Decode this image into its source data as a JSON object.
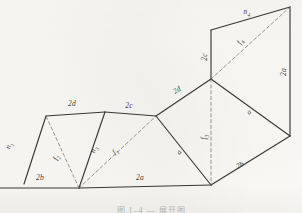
{
  "figure": {
    "background_color": "#fbfaf7",
    "stroke_color": "#2b2a28",
    "dash_color": "#6f6c67",
    "caption": "图 1–4  —  展开图",
    "solid_edges": [
      {
        "name": "edge-2d-upper-left",
        "x1": 24,
        "y1": 184,
        "x2": 46,
        "y2": 116
      },
      {
        "name": "edge-top-left-2d",
        "x1": 46,
        "y1": 116,
        "x2": 105,
        "y2": 112
      },
      {
        "name": "edge-top-2c",
        "x1": 105,
        "y1": 112,
        "x2": 156,
        "y2": 116
      },
      {
        "name": "edge-2d-diagonal-up",
        "x1": 156,
        "y1": 116,
        "x2": 211,
        "y2": 79
      },
      {
        "name": "edge-2c-vertical",
        "x1": 211,
        "y1": 79,
        "x2": 211,
        "y2": 30
      },
      {
        "name": "edge-n4-top",
        "x1": 211,
        "y1": 30,
        "x2": 290,
        "y2": 7
      },
      {
        "name": "edge-2a-right",
        "x1": 290,
        "y1": 7,
        "x2": 290,
        "y2": 136
      },
      {
        "name": "edge-right-lower",
        "x1": 290,
        "y1": 136,
        "x2": 211,
        "y2": 185
      },
      {
        "name": "edge-bottom-2a",
        "x1": 211,
        "y1": 185,
        "x2": 79,
        "y2": 188
      },
      {
        "name": "edge-bottom-2b",
        "x1": 79,
        "y1": 188,
        "x2": 0,
        "y2": 188
      },
      {
        "name": "edge-n3-interior",
        "x1": 79,
        "y1": 188,
        "x2": 105,
        "y2": 112
      },
      {
        "name": "edge-a-interior-left",
        "x1": 211,
        "y1": 185,
        "x2": 156,
        "y2": 116
      },
      {
        "name": "edge-a-interior-right",
        "x1": 211,
        "y1": 79,
        "x2": 290,
        "y2": 136
      }
    ],
    "dashed_edges": [
      {
        "name": "fold-f2",
        "x1": 79,
        "y1": 188,
        "x2": 46,
        "y2": 116
      },
      {
        "name": "fold-f1",
        "x1": 79,
        "y1": 188,
        "x2": 156,
        "y2": 116
      },
      {
        "name": "fold-f3-vertical",
        "x1": 211,
        "y1": 79,
        "x2": 211,
        "y2": 185
      },
      {
        "name": "fold-f4",
        "x1": 211,
        "y1": 79,
        "x2": 290,
        "y2": 7
      }
    ],
    "labels": [
      {
        "name": "label-n1",
        "text": "n",
        "sub": "1",
        "x": 10,
        "y": 146,
        "rot": -70
      },
      {
        "name": "label-2d",
        "text": "2d",
        "sub": "",
        "x": 72,
        "y": 104,
        "rot": 0
      },
      {
        "name": "label-2c",
        "text": "2c",
        "sub": "",
        "x": 129,
        "y": 106,
        "rot": 0
      },
      {
        "name": "label-2b",
        "text": "2b",
        "sub": "",
        "x": 40,
        "y": 178,
        "rot": 0
      },
      {
        "name": "label-2a",
        "text": "2a",
        "sub": "",
        "x": 140,
        "y": 178,
        "rot": 0
      },
      {
        "name": "label-f2",
        "text": "f",
        "sub": "2",
        "x": 57,
        "y": 158,
        "rot": -66
      },
      {
        "name": "label-n3",
        "text": "n",
        "sub": "3",
        "x": 95,
        "y": 150,
        "rot": -70
      },
      {
        "name": "label-f1",
        "text": "f",
        "sub": "1",
        "x": 116,
        "y": 152,
        "rot": -42
      },
      {
        "name": "label-2d2",
        "text": "2d",
        "sub": "",
        "x": 177,
        "y": 90,
        "rot": -33
      },
      {
        "name": "label-2c2",
        "text": "2c",
        "sub": "",
        "x": 205,
        "y": 57,
        "rot": -90
      },
      {
        "name": "label-n4",
        "text": "n",
        "sub": "4",
        "x": 247,
        "y": 13,
        "rot": 0
      },
      {
        "name": "label-f4",
        "text": "f",
        "sub": "4",
        "x": 241,
        "y": 42,
        "rot": -62
      },
      {
        "name": "label-2a2",
        "text": "2a",
        "sub": "",
        "x": 284,
        "y": 72,
        "rot": -90
      },
      {
        "name": "label-f3",
        "text": "f",
        "sub": "3",
        "x": 205,
        "y": 137,
        "rot": -90
      },
      {
        "name": "label-a1",
        "text": "a",
        "sub": "",
        "x": 179,
        "y": 152,
        "rot": -54
      },
      {
        "name": "label-a2",
        "text": "a",
        "sub": "",
        "x": 249,
        "y": 112,
        "rot": -40
      },
      {
        "name": "label-2b2",
        "text": "2b",
        "sub": "",
        "x": 240,
        "y": 165,
        "rot": -29
      }
    ]
  }
}
